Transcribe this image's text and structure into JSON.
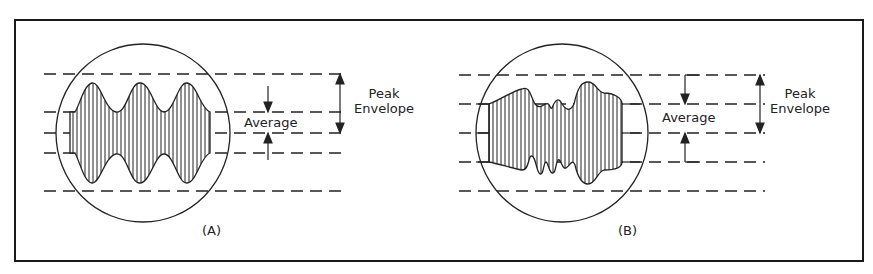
{
  "figure": {
    "panels": [
      {
        "id": "A",
        "caption": "(A)",
        "average_label": "Average",
        "peak_label_line1": "Peak",
        "peak_label_line2": "Envelope",
        "description": "Regular two-tone envelope with three equal peaks"
      },
      {
        "id": "B",
        "caption": "(B)",
        "average_label": "Average",
        "peak_label_line1": "Peak",
        "peak_label_line2": "Envelope",
        "description": "Irregular voice-modulated envelope"
      }
    ],
    "colors": {
      "stroke": "#222222",
      "background": "#ffffff",
      "frame": "#1a1a1a"
    }
  }
}
